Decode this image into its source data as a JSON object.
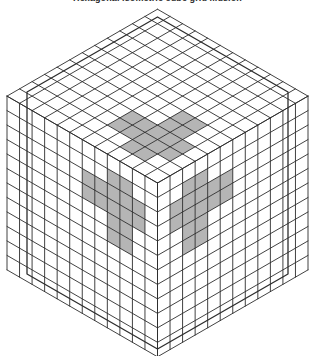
{
  "page": {
    "title": "Hexagonal isometric cube grid illusion",
    "background_color": "#ffffff"
  },
  "figure": {
    "name": "isometric-cube-corner-hexagon",
    "hexagon": {
      "center_x": 157.5,
      "center_y": 183,
      "radius": 166,
      "half_width": 150.5,
      "vertices": [
        [
          157.5,
          17
        ],
        [
          288,
          92
        ],
        [
          288,
          274
        ],
        [
          157.5,
          349
        ],
        [
          27,
          274
        ],
        [
          27,
          92
        ]
      ]
    },
    "grid": {
      "divisions": 12,
      "line_color": "#2d2d2d",
      "line_width": 0.9,
      "outline_width": 1.3,
      "cell_size_px": 12.5
    },
    "highlight": {
      "color": "#a8a8a8",
      "opacity": 0.85,
      "pattern": "six-pointed-star",
      "arm_count": 6,
      "arm_length_cells": 5,
      "arm_inner_cells": 1
    }
  },
  "chart_data": {
    "type": "diagram",
    "title": "Hexagonal isometric cube grid illusion",
    "shape": "regular-hexagon",
    "faces": 3,
    "face_labels": [
      "top",
      "left",
      "right"
    ],
    "grid_divisions_per_face": 12,
    "total_cells": 432,
    "highlight_pattern": "six-pointed star radiating from the central vertex",
    "colors": {
      "line": "#2d2d2d",
      "highlight": "#a8a8a8",
      "background": "#ffffff"
    }
  }
}
